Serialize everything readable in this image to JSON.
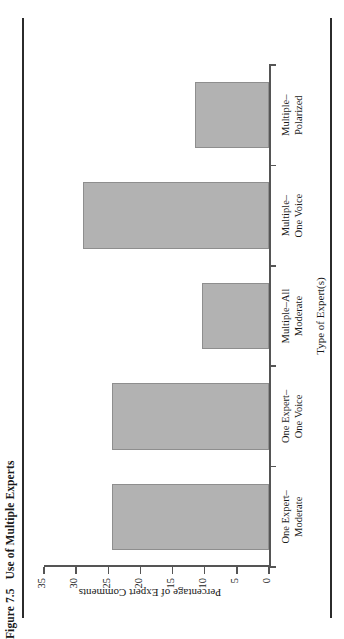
{
  "figure": {
    "number": "Figure 7.5",
    "caption": "Use of Multiple Experts"
  },
  "chart_data": {
    "type": "bar",
    "orientation": "vertical",
    "title": "Use of Multiple Experts",
    "xlabel": "Type of Expert(s)",
    "ylabel": "Percentage of Expert Comments",
    "categories": [
      "One Expert–\nModerate",
      "One Expert–\nOne Voice",
      "Multiple–All\nModerate",
      "Multiple–\nOne Voice",
      "Multiple–\nPolarized"
    ],
    "category_lines": [
      [
        "One Expert–",
        "Moderate"
      ],
      [
        "One Expert–",
        "One Voice"
      ],
      [
        "Multiple–All",
        "Moderate"
      ],
      [
        "Multiple–",
        "One Voice"
      ],
      [
        "Multiple–",
        "Polarized"
      ]
    ],
    "values": [
      24.5,
      24.5,
      10.5,
      29,
      11.5
    ],
    "ylim": [
      0,
      35
    ],
    "yticks": [
      0,
      5,
      10,
      15,
      20,
      25,
      30,
      35
    ],
    "ytick_labels": [
      "0",
      "5",
      "10",
      "15",
      "20",
      "25",
      "30",
      "35"
    ],
    "grid": false,
    "legend": null,
    "bar_color": "#b2b2b2",
    "bar_edge_color": "#8e8e8e",
    "axis_color": "#555555"
  }
}
